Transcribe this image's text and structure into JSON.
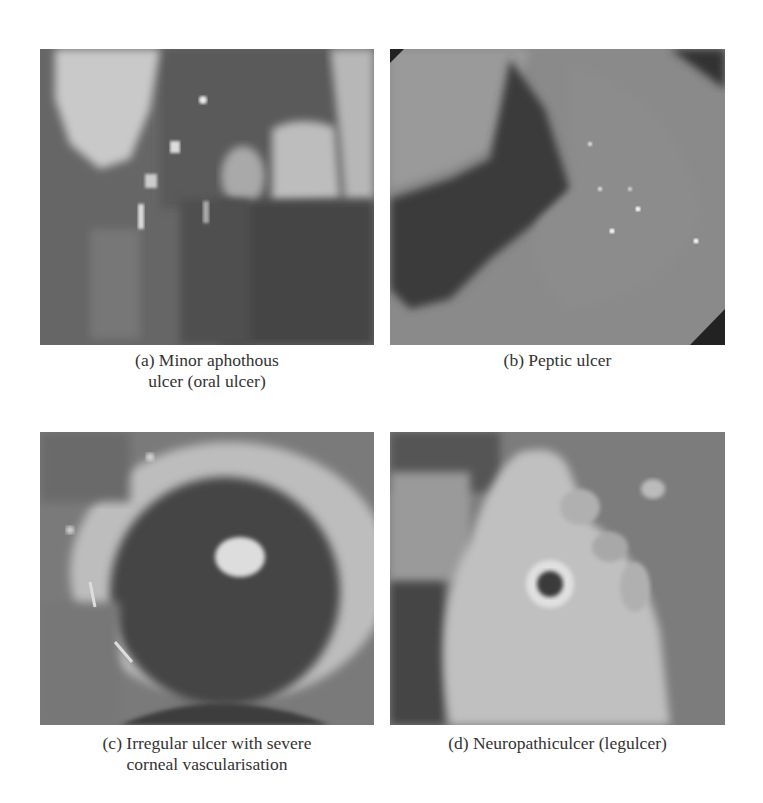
{
  "figure": {
    "panels": [
      {
        "id": "a",
        "caption_line1": "(a) Minor aphothous",
        "caption_line2": "ulcer (oral ulcer)",
        "image_subject": "oral-ulcer-photo"
      },
      {
        "id": "b",
        "caption_line1": "(b) Peptic ulcer",
        "caption_line2": "",
        "image_subject": "peptic-ulcer-endoscopy-photo"
      },
      {
        "id": "c",
        "caption_line1": "(c) Irregular ulcer with severe",
        "caption_line2": "corneal vascularisation",
        "image_subject": "corneal-ulcer-eye-photo"
      },
      {
        "id": "d",
        "caption_line1": "(d) Neuropathiculcer (legulcer)",
        "caption_line2": "",
        "image_subject": "neuropathic-foot-ulcer-photo"
      }
    ]
  },
  "colors": {
    "background": "#ffffff",
    "caption_text": "#333333",
    "photo_mid_gray": "#6e6e6e"
  }
}
